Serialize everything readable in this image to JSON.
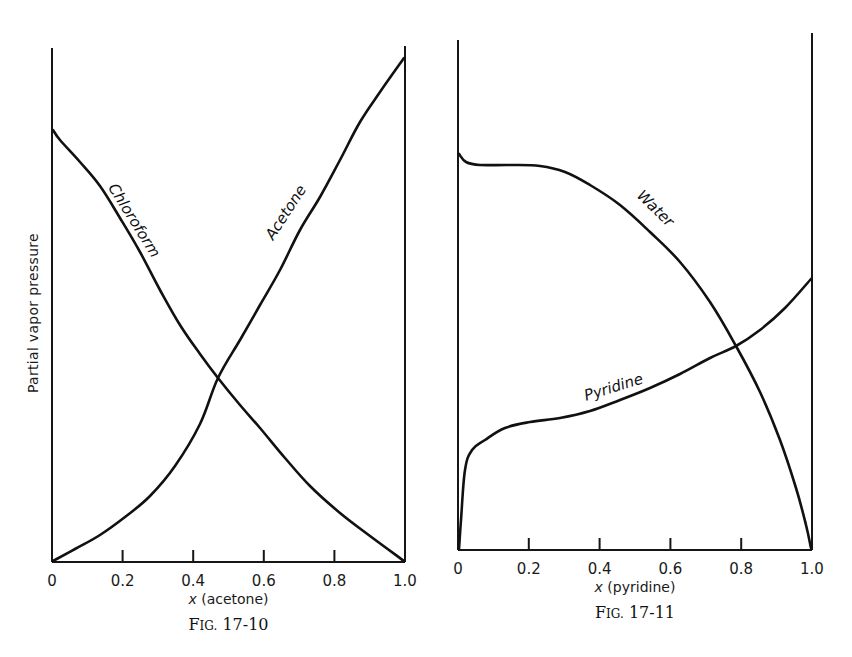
{
  "chart_data": [
    {
      "type": "line",
      "id": "fig-17-10",
      "title": "",
      "caption": "FIG. 17-10",
      "xlabel_var": "x",
      "xlabel": "(acetone)",
      "ylabel": "Partial vapor pressure",
      "xlim": [
        0,
        1.0
      ],
      "ylim": [
        0,
        1.0
      ],
      "y_units": "relative (no tick values shown)",
      "x_ticks": [
        0,
        0.2,
        0.4,
        0.6,
        0.8,
        1.0
      ],
      "x_tick_labels": [
        "0",
        "0.2",
        "0.4",
        "0.6",
        "0.8",
        "1.0"
      ],
      "grid": false,
      "legend": "inline curve labels",
      "series": [
        {
          "name": "Chloroform",
          "x": [
            0,
            0.1,
            0.2,
            0.3,
            0.4,
            0.47,
            0.5,
            0.6,
            0.7,
            0.8,
            0.9,
            1.0
          ],
          "y": [
            0.857,
            0.765,
            0.655,
            0.532,
            0.405,
            0.325,
            0.296,
            0.22,
            0.152,
            0.1,
            0.046,
            0.0
          ]
        },
        {
          "name": "Acetone",
          "x": [
            0,
            0.1,
            0.2,
            0.3,
            0.4,
            0.47,
            0.5,
            0.6,
            0.7,
            0.8,
            0.9,
            1.0
          ],
          "y": [
            0.0,
            0.048,
            0.108,
            0.176,
            0.256,
            0.325,
            0.362,
            0.488,
            0.625,
            0.75,
            0.87,
            0.99
          ]
        }
      ],
      "labels": [
        {
          "text": "Chloroform",
          "x": 0.22,
          "y": 0.6,
          "rotate": 58
        },
        {
          "text": "Acetone",
          "x": 0.64,
          "y": 0.6,
          "rotate": -57
        }
      ]
    },
    {
      "type": "line",
      "id": "fig-17-11",
      "title": "",
      "caption": "FIG. 17-11",
      "xlabel_var": "x",
      "xlabel": "(pyridine)",
      "ylabel": "",
      "xlim": [
        0,
        1.0
      ],
      "ylim": [
        0,
        1.0
      ],
      "y_units": "relative (no tick values shown)",
      "x_ticks": [
        0,
        0.2,
        0.4,
        0.6,
        0.8,
        1.0
      ],
      "x_tick_labels": [
        "0",
        "0.2",
        "0.4",
        "0.6",
        "0.8",
        "1.0"
      ],
      "grid": false,
      "legend": "inline curve labels",
      "series": [
        {
          "name": "Water",
          "x": [
            0,
            0.03,
            0.08,
            0.15,
            0.22,
            0.3,
            0.4,
            0.5,
            0.6,
            0.7,
            0.79,
            0.85,
            0.92,
            0.97,
            1.0
          ],
          "y": [
            0.81,
            0.79,
            0.782,
            0.782,
            0.778,
            0.755,
            0.705,
            0.635,
            0.55,
            0.44,
            0.41,
            0.305,
            0.19,
            0.09,
            0.0
          ]
        },
        {
          "name": "Pyridine",
          "x": [
            0,
            0.005,
            0.02,
            0.05,
            0.1,
            0.15,
            0.2,
            0.3,
            0.4,
            0.5,
            0.6,
            0.7,
            0.79,
            0.9,
            1.0
          ],
          "y": [
            0.0,
            0.08,
            0.22,
            0.295,
            0.325,
            0.338,
            0.345,
            0.356,
            0.378,
            0.405,
            0.44,
            0.485,
            0.41,
            0.5,
            0.56
          ]
        }
      ],
      "labels": [
        {
          "text": "Water",
          "x": 0.53,
          "y": 0.68,
          "rotate": 44
        },
        {
          "text": "Pyridine",
          "x": 0.45,
          "y": 0.45,
          "rotate": -17
        }
      ]
    }
  ],
  "layout": {
    "panels": [
      {
        "left": 52,
        "right": 405,
        "top": 48,
        "base": 562,
        "axis_top_left": 48,
        "axis_top_right": 46
      },
      {
        "left": 458,
        "right": 812,
        "top": 40,
        "base": 550,
        "axis_top_left": 40,
        "axis_top_right": 33
      }
    ]
  }
}
